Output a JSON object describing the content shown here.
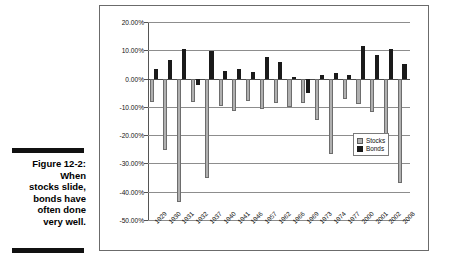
{
  "caption": {
    "figure_number": "Figure 12-2:",
    "lines": [
      "When",
      "stocks slide,",
      "bonds have",
      "often done",
      "very well."
    ]
  },
  "legend": {
    "position": "inside-right",
    "entries": [
      {
        "label": "Stocks",
        "color": "#b0b0b0",
        "icon": "legend-swatch-stocks"
      },
      {
        "label": "Bonds",
        "color": "#1a1a1a",
        "icon": "legend-swatch-bonds"
      }
    ]
  },
  "axis": {
    "y_ticks": [
      "20.00%",
      "10.00%",
      "0.00%",
      "-10.00%",
      "-20.00%",
      "-30.00%",
      "-40.00%",
      "-50.00%"
    ],
    "y_tick_values": [
      20,
      10,
      0,
      -10,
      -20,
      -30,
      -40,
      -50
    ]
  },
  "chart_data": {
    "type": "bar",
    "title": "",
    "subtitle": "",
    "xlabel": "",
    "ylabel": "",
    "ylim": [
      -50,
      20
    ],
    "grid": true,
    "legend_position": "inside-right",
    "categories": [
      "1929",
      "1930",
      "1931",
      "1932",
      "1937",
      "1940",
      "1941",
      "1946",
      "1957",
      "1962",
      "1966",
      "1969",
      "1973",
      "1974",
      "1977",
      "2000",
      "2001",
      "2002",
      "2008"
    ],
    "series": [
      {
        "name": "Stocks",
        "color": "#b0b0b0",
        "values": [
          -8.3,
          -25.1,
          -43.5,
          -8.4,
          -35.0,
          -9.8,
          -11.6,
          -8.1,
          -10.8,
          -8.7,
          -10.1,
          -8.5,
          -14.7,
          -26.5,
          -7.2,
          -9.1,
          -11.9,
          -22.1,
          -37.0
        ]
      },
      {
        "name": "Bonds",
        "color": "#1a1a1a",
        "values": [
          3.4,
          6.6,
          10.4,
          -2.3,
          9.6,
          2.8,
          3.3,
          2.5,
          7.5,
          5.9,
          0.7,
          -5.1,
          1.1,
          2.0,
          1.4,
          11.6,
          8.4,
          10.3,
          5.2
        ]
      }
    ]
  }
}
